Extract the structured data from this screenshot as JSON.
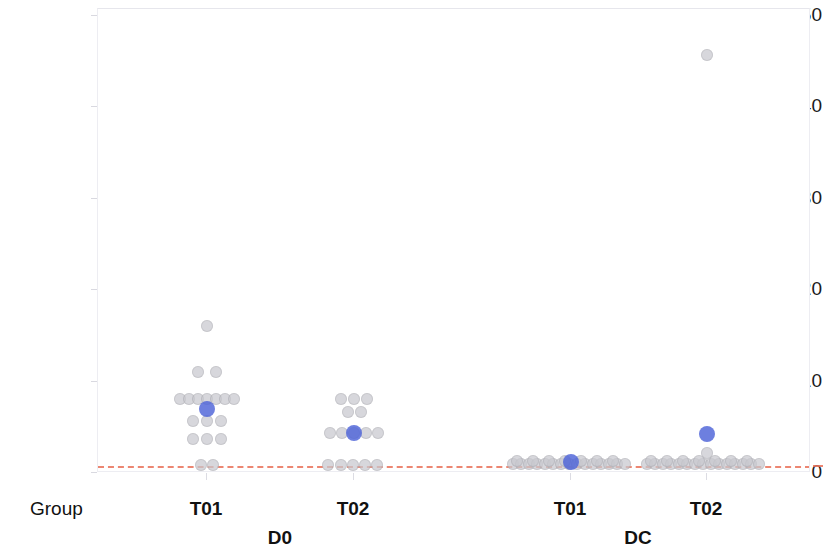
{
  "chart_data": {
    "type": "scatter",
    "title": "",
    "subtitle": "",
    "xlabel": "Group",
    "ylabel": "Individual NA titers",
    "ylim": [
      0,
      50
    ],
    "yticks": [
      0,
      10,
      20,
      30,
      40,
      50
    ],
    "ytick_labels": [
      "0",
      "10",
      "20",
      "30",
      "40",
      "50"
    ],
    "grid": false,
    "legend": null,
    "axis_row_caption": "Group",
    "x_tick_labels": [
      "T01",
      "T02",
      "T01",
      "T02"
    ],
    "x_super_labels": [
      "D0",
      "DC"
    ],
    "annotations": [
      {
        "label": "limit of detection reference line",
        "y": 1.0,
        "style": "dashed",
        "color": "#e9715a"
      }
    ],
    "colors": {
      "sample_point": "#c9c9cf",
      "mean_point": "#4d63d8",
      "reference_line": "#e9715a",
      "panel_border": "#ededf2",
      "text": "#111111"
    },
    "series": [
      {
        "name": "Sample titers",
        "marker": "circle",
        "color": "#c9c9cf",
        "role": "individual",
        "groups": [
          {
            "timepoint": "D0",
            "group": "T01",
            "x_center": 206,
            "values": [
              16.5,
              11.3,
              11.3,
              8.3,
              8.3,
              8.3,
              8.3,
              8.3,
              8.3,
              8.3,
              5.8,
              5.8,
              5.8,
              3.8,
              3.8,
              3.8,
              1.0,
              1.0
            ]
          },
          {
            "timepoint": "D0",
            "group": "T02",
            "x_center": 353,
            "values": [
              8.3,
              8.3,
              8.3,
              6.8,
              6.8,
              4.4,
              4.4,
              4.4,
              4.4,
              4.4,
              1.0,
              1.0,
              1.0,
              1.0,
              1.0
            ]
          },
          {
            "timepoint": "DC",
            "group": "T01",
            "x_center": 570,
            "values": [
              1.2,
              1.2,
              1.2,
              1.2,
              1.2,
              1.2,
              1.2,
              1.2,
              1.2,
              1.2,
              1.2,
              1.2,
              1.2,
              1.2,
              1.2,
              1.2,
              1.2,
              1.2,
              1.2,
              1.2,
              1.2,
              1.2,
              1.2,
              1.2,
              1.2,
              1.2,
              1.2,
              1.2,
              1.2,
              1.2
            ]
          },
          {
            "timepoint": "DC",
            "group": "T02",
            "x_center": 706,
            "values": [
              45.5,
              2.3,
              1.2,
              1.2,
              1.2,
              1.2,
              1.2,
              1.2,
              1.2,
              1.2,
              1.2,
              1.2,
              1.2,
              1.2,
              1.2,
              1.2,
              1.2,
              1.2,
              1.2,
              1.2,
              1.2,
              1.2,
              1.2,
              1.2,
              1.2,
              1.2,
              1.2,
              1.2,
              1.2,
              1.2
            ]
          }
        ]
      },
      {
        "name": "Group mean",
        "marker": "circle",
        "color": "#4d63d8",
        "role": "mean",
        "points": [
          {
            "timepoint": "D0",
            "group": "T01",
            "x_center": 206,
            "value": 7.2
          },
          {
            "timepoint": "D0",
            "group": "T02",
            "x_center": 353,
            "value": 4.5
          },
          {
            "timepoint": "DC",
            "group": "T01",
            "x_center": 570,
            "value": 1.2
          },
          {
            "timepoint": "DC",
            "group": "T02",
            "x_center": 706,
            "value": 4.4
          }
        ]
      }
    ],
    "point_layout": {
      "comment": "pixel placement of every rendered marker, original image coordinates",
      "sample_markers": [
        {
          "x": 206,
          "y": 325,
          "r": 6
        },
        {
          "x": 197,
          "y": 371,
          "r": 6
        },
        {
          "x": 215,
          "y": 371,
          "r": 6
        },
        {
          "x": 179,
          "y": 398,
          "r": 6
        },
        {
          "x": 188,
          "y": 398,
          "r": 6
        },
        {
          "x": 197,
          "y": 398,
          "r": 6
        },
        {
          "x": 206,
          "y": 398,
          "r": 6
        },
        {
          "x": 215,
          "y": 398,
          "r": 6
        },
        {
          "x": 224,
          "y": 398,
          "r": 6
        },
        {
          "x": 233,
          "y": 398,
          "r": 6
        },
        {
          "x": 192,
          "y": 420,
          "r": 6
        },
        {
          "x": 206,
          "y": 420,
          "r": 6
        },
        {
          "x": 220,
          "y": 420,
          "r": 6
        },
        {
          "x": 192,
          "y": 438,
          "r": 6
        },
        {
          "x": 206,
          "y": 438,
          "r": 6
        },
        {
          "x": 220,
          "y": 438,
          "r": 6
        },
        {
          "x": 200,
          "y": 464,
          "r": 6
        },
        {
          "x": 212,
          "y": 464,
          "r": 6
        },
        {
          "x": 340,
          "y": 398,
          "r": 6
        },
        {
          "x": 353,
          "y": 398,
          "r": 6
        },
        {
          "x": 366,
          "y": 398,
          "r": 6
        },
        {
          "x": 347,
          "y": 411,
          "r": 6
        },
        {
          "x": 360,
          "y": 411,
          "r": 6
        },
        {
          "x": 329,
          "y": 432,
          "r": 6
        },
        {
          "x": 341,
          "y": 432,
          "r": 6
        },
        {
          "x": 353,
          "y": 432,
          "r": 6
        },
        {
          "x": 365,
          "y": 432,
          "r": 6
        },
        {
          "x": 377,
          "y": 432,
          "r": 6
        },
        {
          "x": 327,
          "y": 464,
          "r": 6
        },
        {
          "x": 340,
          "y": 464,
          "r": 6
        },
        {
          "x": 352,
          "y": 464,
          "r": 6
        },
        {
          "x": 364,
          "y": 464,
          "r": 6
        },
        {
          "x": 376,
          "y": 464,
          "r": 6
        },
        {
          "x": 512,
          "y": 463,
          "r": 6
        },
        {
          "x": 520,
          "y": 463,
          "r": 6
        },
        {
          "x": 528,
          "y": 463,
          "r": 6
        },
        {
          "x": 536,
          "y": 463,
          "r": 6
        },
        {
          "x": 544,
          "y": 463,
          "r": 6
        },
        {
          "x": 552,
          "y": 463,
          "r": 6
        },
        {
          "x": 560,
          "y": 463,
          "r": 6
        },
        {
          "x": 568,
          "y": 463,
          "r": 6
        },
        {
          "x": 576,
          "y": 463,
          "r": 6
        },
        {
          "x": 584,
          "y": 463,
          "r": 6
        },
        {
          "x": 592,
          "y": 463,
          "r": 6
        },
        {
          "x": 600,
          "y": 463,
          "r": 6
        },
        {
          "x": 608,
          "y": 463,
          "r": 6
        },
        {
          "x": 616,
          "y": 463,
          "r": 6
        },
        {
          "x": 624,
          "y": 463,
          "r": 6
        },
        {
          "x": 516,
          "y": 460,
          "r": 6
        },
        {
          "x": 532,
          "y": 460,
          "r": 6
        },
        {
          "x": 548,
          "y": 460,
          "r": 6
        },
        {
          "x": 564,
          "y": 460,
          "r": 6
        },
        {
          "x": 580,
          "y": 460,
          "r": 6
        },
        {
          "x": 596,
          "y": 460,
          "r": 6
        },
        {
          "x": 612,
          "y": 460,
          "r": 6
        },
        {
          "x": 706,
          "y": 54,
          "r": 6
        },
        {
          "x": 706,
          "y": 452,
          "r": 6
        },
        {
          "x": 646,
          "y": 463,
          "r": 6
        },
        {
          "x": 654,
          "y": 463,
          "r": 6
        },
        {
          "x": 662,
          "y": 463,
          "r": 6
        },
        {
          "x": 670,
          "y": 463,
          "r": 6
        },
        {
          "x": 678,
          "y": 463,
          "r": 6
        },
        {
          "x": 686,
          "y": 463,
          "r": 6
        },
        {
          "x": 694,
          "y": 463,
          "r": 6
        },
        {
          "x": 702,
          "y": 463,
          "r": 6
        },
        {
          "x": 710,
          "y": 463,
          "r": 6
        },
        {
          "x": 718,
          "y": 463,
          "r": 6
        },
        {
          "x": 726,
          "y": 463,
          "r": 6
        },
        {
          "x": 734,
          "y": 463,
          "r": 6
        },
        {
          "x": 742,
          "y": 463,
          "r": 6
        },
        {
          "x": 750,
          "y": 463,
          "r": 6
        },
        {
          "x": 758,
          "y": 463,
          "r": 6
        },
        {
          "x": 650,
          "y": 460,
          "r": 6
        },
        {
          "x": 666,
          "y": 460,
          "r": 6
        },
        {
          "x": 682,
          "y": 460,
          "r": 6
        },
        {
          "x": 698,
          "y": 460,
          "r": 6
        },
        {
          "x": 714,
          "y": 460,
          "r": 6
        },
        {
          "x": 730,
          "y": 460,
          "r": 6
        },
        {
          "x": 746,
          "y": 460,
          "r": 6
        }
      ],
      "mean_markers": [
        {
          "x": 206,
          "y": 408,
          "r": 8
        },
        {
          "x": 353,
          "y": 432,
          "r": 8
        },
        {
          "x": 570,
          "y": 461,
          "r": 8
        },
        {
          "x": 706,
          "y": 433,
          "r": 8
        }
      ]
    },
    "axis_geometry": {
      "panel_left_px": 97,
      "panel_top_px": 8,
      "panel_width_px": 713,
      "panel_height_px": 464,
      "y0_px": 472,
      "px_per_unit": 9.14,
      "refline_y_px": 465,
      "xtick_px": [
        206,
        353,
        570,
        706
      ],
      "xsuper_px": [
        280,
        638
      ]
    }
  }
}
